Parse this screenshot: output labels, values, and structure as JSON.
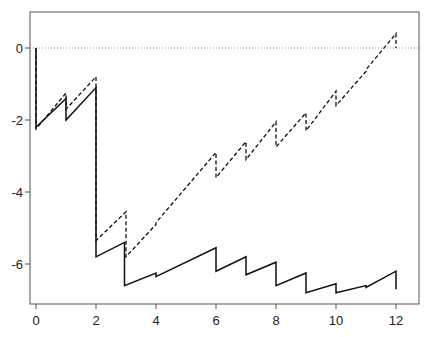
{
  "chart_data": {
    "type": "line",
    "title": "",
    "xlabel": "",
    "ylabel": "",
    "xlim": [
      -0.2,
      12.75
    ],
    "ylim": [
      -7.2,
      1.0
    ],
    "x_ticks": [
      0,
      2,
      4,
      6,
      8,
      10,
      12
    ],
    "y_ticks": [
      0,
      -2,
      -4,
      -6
    ],
    "x_tick_labels": [
      "0",
      "2",
      "4",
      "6",
      "8",
      "10",
      "12"
    ],
    "y_tick_labels": [
      "0",
      "-2",
      "-4",
      "-6"
    ],
    "grid": false,
    "reference_line": {
      "y": 0,
      "style": "dotted",
      "color": "#999999"
    },
    "legend": null,
    "series": [
      {
        "name": "solid",
        "style": "solid",
        "color": "#111111",
        "points": [
          [
            0,
            0
          ],
          [
            0,
            -2.2
          ],
          [
            1,
            -1.4
          ],
          [
            1,
            -2.0
          ],
          [
            2,
            -1.1
          ],
          [
            2,
            -5.8
          ],
          [
            2.95,
            -5.4
          ],
          [
            2.95,
            -6.6
          ],
          [
            4,
            -6.25
          ],
          [
            4,
            -6.35
          ],
          [
            6,
            -5.55
          ],
          [
            6,
            -6.2
          ],
          [
            7,
            -5.8
          ],
          [
            7,
            -6.3
          ],
          [
            8,
            -5.95
          ],
          [
            8,
            -6.6
          ],
          [
            9,
            -6.25
          ],
          [
            9,
            -6.8
          ],
          [
            10,
            -6.55
          ],
          [
            10,
            -6.8
          ],
          [
            11,
            -6.6
          ],
          [
            11,
            -6.65
          ],
          [
            12,
            -6.2
          ],
          [
            12,
            -6.7
          ]
        ]
      },
      {
        "name": "dashed",
        "style": "dashed",
        "color": "#111111",
        "points": [
          [
            0,
            0
          ],
          [
            0,
            -2.25
          ],
          [
            1,
            -1.25
          ],
          [
            1,
            -1.7
          ],
          [
            2,
            -0.8
          ],
          [
            2,
            -5.35
          ],
          [
            3,
            -4.55
          ],
          [
            3,
            -5.8
          ],
          [
            4,
            -4.9
          ],
          [
            4,
            -4.85
          ],
          [
            6,
            -2.9
          ],
          [
            6,
            -3.6
          ],
          [
            7,
            -2.6
          ],
          [
            7,
            -3.1
          ],
          [
            8,
            -2.05
          ],
          [
            8,
            -2.75
          ],
          [
            9,
            -1.8
          ],
          [
            9,
            -2.3
          ],
          [
            10,
            -1.2
          ],
          [
            10,
            -1.6
          ],
          [
            11,
            -0.65
          ],
          [
            11,
            -0.6
          ],
          [
            12,
            0.4
          ],
          [
            12,
            0.0
          ]
        ]
      }
    ]
  },
  "layout": {
    "plot_left": 30,
    "plot_right": 419,
    "plot_top": 12,
    "plot_bottom": 304,
    "x0_px": 36,
    "px_per_x": 30,
    "y0_px": 48,
    "px_per_y": 36
  }
}
